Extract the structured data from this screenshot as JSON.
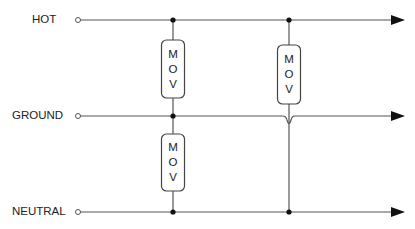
{
  "diagram": {
    "lines": [
      {
        "label": "HOT",
        "y": 20
      },
      {
        "label": "GROUND",
        "y": 116
      },
      {
        "label": "NEUTRAL",
        "y": 212
      }
    ],
    "components": [
      {
        "name": "MOV",
        "letters": [
          "M",
          "O",
          "V"
        ],
        "from": "HOT",
        "to": "GROUND"
      },
      {
        "name": "MOV",
        "letters": [
          "M",
          "O",
          "V"
        ],
        "from": "HOT",
        "to": "NEUTRAL",
        "crosses": "GROUND"
      },
      {
        "name": "MOV",
        "letters": [
          "M",
          "O",
          "V"
        ],
        "from": "GROUND",
        "to": "NEUTRAL"
      }
    ],
    "colors": {
      "wire": "#555555",
      "junction": "#111111",
      "text": "#222222",
      "background": "#ffffff"
    }
  }
}
